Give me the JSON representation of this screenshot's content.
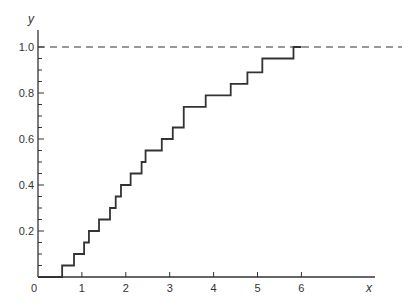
{
  "chart_data": {
    "type": "line",
    "subtype": "step",
    "title": "",
    "xlabel": "x",
    "ylabel": "y",
    "xlim": [
      0,
      8
    ],
    "ylim": [
      0,
      1.1
    ],
    "grid": false,
    "legend": null,
    "x_ticks": [
      0,
      1,
      2,
      3,
      4,
      5,
      6
    ],
    "x_tick_labels": [
      "0",
      "1",
      "2",
      "3",
      "4",
      "5",
      "6"
    ],
    "y_ticks_major": [
      0.2,
      0.4,
      0.6,
      0.8,
      1.0
    ],
    "y_tick_labels": [
      "0.2",
      "0.4",
      "0.6",
      "0.8",
      "1.0"
    ],
    "y_ticks_minor_step": 0.05,
    "reference_line": {
      "y": 1.0,
      "style": "dashed",
      "x_from": 0,
      "x_to": 8.2
    },
    "series": [
      {
        "name": "empirical step function",
        "step_x": [
          0.55,
          0.82,
          1.05,
          1.16,
          1.39,
          1.64,
          1.77,
          1.89,
          2.11,
          2.36,
          2.45,
          2.82,
          3.07,
          3.32,
          3.82,
          4.39,
          4.77,
          5.11,
          5.82
        ],
        "step_y": [
          0.05,
          0.1,
          0.15,
          0.2,
          0.25,
          0.3,
          0.35,
          0.4,
          0.45,
          0.5,
          0.55,
          0.6,
          0.65,
          0.74,
          0.79,
          0.84,
          0.89,
          0.95,
          1.0
        ],
        "x_end": 6.0
      }
    ]
  },
  "labels": {
    "x_axis": "x",
    "y_axis": "y",
    "origin": "0"
  }
}
